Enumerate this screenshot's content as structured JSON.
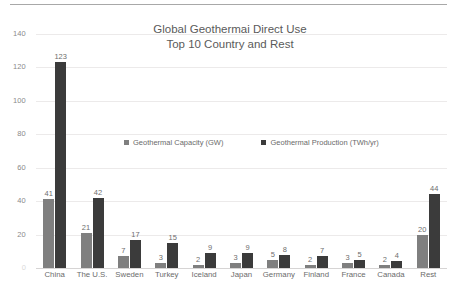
{
  "chart_data": {
    "type": "bar",
    "title": "Global Geothermai Direct Use\nTop 10 Country and Rest",
    "title_lines": [
      "Global Geothermai Direct Use",
      "Top 10 Country and Rest"
    ],
    "xlabel": "",
    "ylabel": "",
    "ylim": [
      0,
      140
    ],
    "yticks": [
      140,
      120,
      100,
      80,
      60,
      40,
      20,
      0
    ],
    "ytick_labels": [
      "140",
      "120",
      "100",
      "80",
      "60",
      "40",
      "20",
      "0"
    ],
    "grid": true,
    "legend_position": "inside-upper-center",
    "categories": [
      "China",
      "The U.S.",
      "Sweden",
      "Turkey",
      "Iceland",
      "Japan",
      "Germany",
      "Finland",
      "France",
      "Canada",
      "Rest"
    ],
    "series": [
      {
        "name": "Geothermal Capacity (GW)",
        "color": "#7f7f7f",
        "values": [
          41,
          21,
          7,
          3,
          2,
          3,
          5,
          2,
          3,
          2,
          20
        ]
      },
      {
        "name": "Geothermal Production (TWh/yr)",
        "color": "#3b3b3b",
        "values": [
          123,
          42,
          17,
          15,
          9,
          9,
          8,
          7,
          5,
          4,
          44
        ]
      }
    ]
  },
  "colors": {
    "capacity": "#7f7f7f",
    "production": "#3b3b3b",
    "gridline": "#eceaea",
    "baseline": "#d6d4d4",
    "text": "#6b6b6b",
    "top_rule": "#a8a8a8"
  }
}
